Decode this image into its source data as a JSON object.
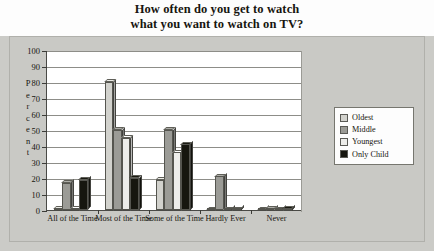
{
  "chart_data": {
    "type": "bar",
    "title": "How often do you get to watch what you want to watch on TV?",
    "title_line1": "How often do you get to watch",
    "title_line2": "what you want to watch on TV?",
    "xlabel": "",
    "ylabel": "Percent",
    "ylim": [
      0,
      100
    ],
    "ytick_step": 10,
    "grid": true,
    "legend_position": "right",
    "categories": [
      "All of the Time",
      "Most of the Time",
      "Some of the Time",
      "Hardly Ever",
      "Never"
    ],
    "series": [
      {
        "name": "Oldest",
        "color": "#d2d2cd",
        "values": [
          1,
          80,
          19,
          0,
          0
        ]
      },
      {
        "name": "Middle",
        "color": "#9b9b96",
        "values": [
          17,
          50,
          50,
          21,
          1
        ]
      },
      {
        "name": "Youngest",
        "color": "#ededea",
        "values": [
          1,
          45,
          36,
          0,
          0
        ]
      },
      {
        "name": "Only Child",
        "color": "#16160f",
        "values": [
          19,
          20,
          41,
          0,
          1
        ]
      }
    ],
    "ytick_labels": [
      "0",
      "10",
      "20",
      "30",
      "40",
      "50",
      "60",
      "70",
      "80",
      "90",
      "100"
    ]
  },
  "colors": {
    "page_background": "#cbcbc7",
    "title_band": "#fdfdfd",
    "plot_background": "#ffffff",
    "axis": "#4a4a46",
    "gridline": "#8d8d88"
  },
  "yaxis_title_letters": [
    "P",
    "e",
    "r",
    "c",
    "e",
    "n",
    "t"
  ]
}
